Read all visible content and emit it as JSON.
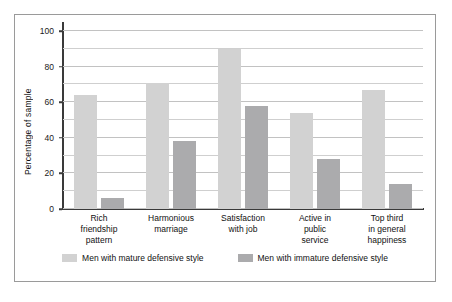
{
  "chart_data": {
    "type": "bar",
    "title": "",
    "xlabel": "",
    "ylabel": "Percentage of sample",
    "ylim": [
      0,
      100
    ],
    "yticks": [
      0,
      20,
      40,
      60,
      80,
      100
    ],
    "grid": true,
    "gridline_interval": 10,
    "legend_position": "bottom",
    "categories": [
      "Rich friendship pattern",
      "Harmonious marriage",
      "Satisfaction with job",
      "Active in public service",
      "Top third in general happiness"
    ],
    "category_lines": [
      [
        "Rich",
        "friendship",
        "pattern"
      ],
      [
        "Harmonious",
        "marriage"
      ],
      [
        "Satisfaction",
        "with job"
      ],
      [
        "Active in",
        "public",
        "service"
      ],
      [
        "Top third",
        "in general",
        "happiness"
      ]
    ],
    "series": [
      {
        "name": "Men with mature defensive style",
        "color": "#d2d2d2",
        "values": [
          64,
          71,
          90,
          54,
          67
        ]
      },
      {
        "name": "Men with immature defensive style",
        "color": "#ababad",
        "values": [
          6,
          38,
          58,
          28,
          14
        ]
      }
    ]
  }
}
